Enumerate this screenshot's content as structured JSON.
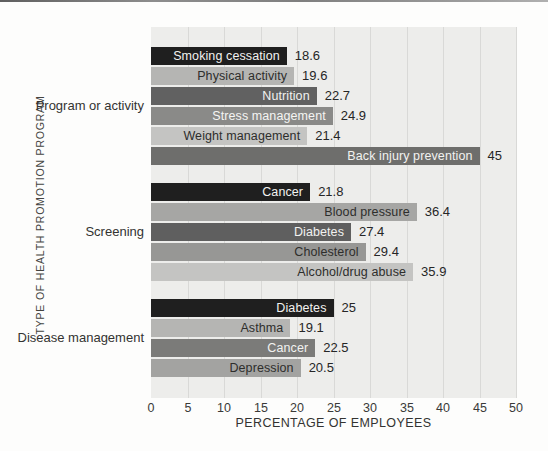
{
  "page": {
    "background": "#fdfdfc",
    "top_edge_rule_color": "#7f7f7f"
  },
  "chart_data": {
    "type": "bar",
    "orientation": "horizontal",
    "title": "",
    "xlabel": "PERCENTAGE OF EMPLOYEES",
    "ylabel": "TYPE OF HEALTH PROMOTION PROGRAM",
    "xlim": [
      0,
      50
    ],
    "xticks": [
      0,
      5,
      10,
      15,
      20,
      25,
      30,
      35,
      40,
      45,
      50
    ],
    "grid": true,
    "plot_bg": "#ededeb",
    "grid_color": "#d9d9d7",
    "legend": "none",
    "value_labels": "outside-right",
    "category_labels": "inside-right",
    "groups": [
      {
        "label": "Program or activity",
        "bars": [
          {
            "label": "Smoking cessation",
            "value": 18.6,
            "color": "#1f1f1f",
            "text_color": "#f2f2f0"
          },
          {
            "label": "Physical activity",
            "value": 19.6,
            "color": "#b5b5b3",
            "text_color": "#2e2e2c"
          },
          {
            "label": "Nutrition",
            "value": 22.7,
            "color": "#616161",
            "text_color": "#f2f2f0"
          },
          {
            "label": "Stress management",
            "value": 24.9,
            "color": "#8a8a88",
            "text_color": "#f5f5f3"
          },
          {
            "label": "Weight management",
            "value": 21.4,
            "color": "#c4c4c2",
            "text_color": "#2e2e2c"
          },
          {
            "label": "Back injury prevention",
            "value": 45,
            "color": "#6e6e6c",
            "text_color": "#f2f2f0"
          }
        ]
      },
      {
        "label": "Screening",
        "bars": [
          {
            "label": "Cancer",
            "value": 21.8,
            "color": "#1f1f1f",
            "text_color": "#f2f2f0"
          },
          {
            "label": "Blood pressure",
            "value": 36.4,
            "color": "#a6a6a4",
            "text_color": "#2e2e2c"
          },
          {
            "label": "Diabetes",
            "value": 27.4,
            "color": "#5f5f5f",
            "text_color": "#f2f2f0"
          },
          {
            "label": "Cholesterol",
            "value": 29.4,
            "color": "#979795",
            "text_color": "#2e2e2c"
          },
          {
            "label": "Alcohol/drug abuse",
            "value": 35.9,
            "color": "#c4c4c2",
            "text_color": "#2e2e2c"
          }
        ]
      },
      {
        "label": "Disease management",
        "bars": [
          {
            "label": "Diabetes",
            "value": 25,
            "color": "#1f1f1f",
            "text_color": "#f2f2f0"
          },
          {
            "label": "Asthma",
            "value": 19.1,
            "color": "#b5b5b3",
            "text_color": "#2e2e2c"
          },
          {
            "label": "Cancer",
            "value": 22.5,
            "color": "#7b7b79",
            "text_color": "#f2f2f0"
          },
          {
            "label": "Depression",
            "value": 20.5,
            "color": "#a3a3a1",
            "text_color": "#2e2e2c"
          }
        ]
      }
    ]
  }
}
